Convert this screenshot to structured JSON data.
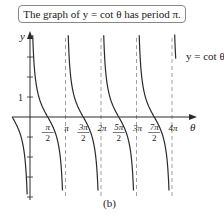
{
  "chart_data": {
    "type": "line",
    "title": "The graph of y = cot θ has period π.",
    "function": "y = cot θ",
    "curve_label": "y = cot θ",
    "xlabel": "θ",
    "ylabel": "y",
    "caption": "(b)",
    "period": "π",
    "x_ticks": [
      "π/2",
      "π",
      "3π/2",
      "2π",
      "5π/2",
      "3π",
      "7π/2",
      "4π"
    ],
    "x_tick_values": [
      1.5708,
      3.1416,
      4.7124,
      6.2832,
      7.854,
      9.4248,
      10.9956,
      12.5664
    ],
    "y_ticks": [
      1
    ],
    "asymptotes": [
      "π",
      "2π",
      "3π",
      "4π"
    ],
    "zeros": [
      "π/2",
      "3π/2",
      "5π/2",
      "7π/2"
    ],
    "xlim": [
      -0.5,
      13.3
    ],
    "ylim": [
      -4,
      4
    ],
    "grid": false
  },
  "title_box": {
    "text": "The graph of y = cot θ has period π."
  },
  "axes": {
    "x_label": "θ",
    "y_label": "y",
    "y_tick_label": "1",
    "tick_labels": [
      {
        "num": "π",
        "den": "2"
      },
      {
        "num": "π",
        "den": ""
      },
      {
        "num": "3π",
        "den": "2"
      },
      {
        "num": "2π",
        "den": ""
      },
      {
        "num": "5π",
        "den": "2"
      },
      {
        "num": "3π",
        "den": ""
      },
      {
        "num": "7π",
        "den": "2"
      },
      {
        "num": "4π",
        "den": ""
      }
    ]
  },
  "curve_label": "y = cot θ",
  "caption": "(b)",
  "colors": {
    "curve": "#2a2a2a",
    "axis": "#2a2a2a",
    "asymptote": "#888888",
    "title_border": "#888888"
  }
}
